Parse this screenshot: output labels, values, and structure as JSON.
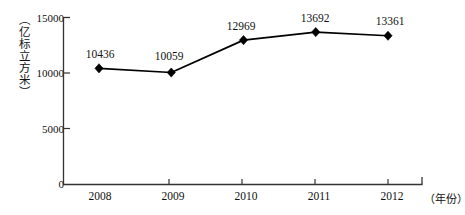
{
  "chart_data": {
    "type": "line",
    "title": "",
    "subtitle": "",
    "xlabel": "（年份）",
    "ylabel": "（亿标立方米）",
    "categories": [
      "2008",
      "2009",
      "2010",
      "2011",
      "2012"
    ],
    "x": [
      2008,
      2009,
      2010,
      2011,
      2012
    ],
    "values": [
      10436,
      10059,
      12969,
      13692,
      13361
    ],
    "point_labels": [
      "10436",
      "10059",
      "12969",
      "13692",
      "13361"
    ],
    "series": [
      {
        "name": "",
        "values": [
          10436,
          10059,
          12969,
          13692,
          13361
        ],
        "marker": "diamond",
        "color": "#000000"
      }
    ],
    "ylim": [
      0,
      15000
    ],
    "yticks": [
      0,
      5000,
      10000,
      15000
    ],
    "ytick_labels": [
      "0",
      "5000",
      "10000",
      "15000"
    ],
    "xtick_labels": [
      "2008",
      "2009",
      "2010",
      "2011",
      "2012"
    ],
    "grid": false,
    "legend": null,
    "legend_position": "none",
    "axis_color": "#333333",
    "line_color": "#000000",
    "marker_color": "#000000",
    "background": "#ffffff"
  },
  "axes": {
    "y_title": "（亿标立方米）",
    "x_title": "（年份）"
  }
}
